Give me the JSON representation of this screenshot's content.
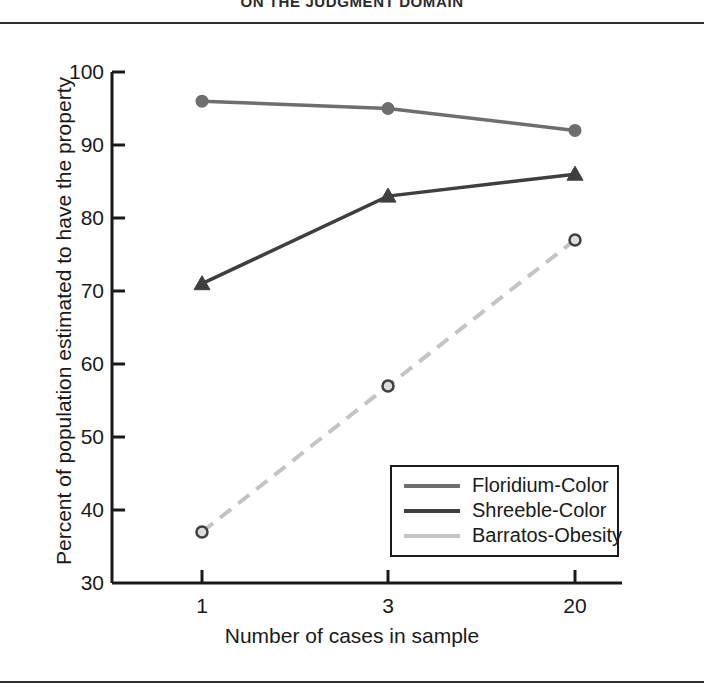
{
  "page": {
    "header_title": "ON THE JUDGMENT DOMAIN"
  },
  "colors": {
    "floridium": "#6e6e6e",
    "shreeble": "#3f3f3f",
    "barratos": "#c4c4c4",
    "axis": "#1a1a1a",
    "background": "#ffffff"
  },
  "chart_data": {
    "type": "line",
    "title": "",
    "xlabel": "Number of cases in sample",
    "ylabel": "Percent of population estimated to have the property",
    "categories": [
      "1",
      "3",
      "20"
    ],
    "xtick_labels": [
      "1",
      "3",
      "20"
    ],
    "ytick_labels": [
      "100",
      "90",
      "80",
      "70",
      "60",
      "50",
      "40",
      "30"
    ],
    "ylim": [
      30,
      100
    ],
    "ytick_step": 10,
    "grid": false,
    "legend_position": "lower right",
    "series": [
      {
        "name": "Floridium-Color",
        "values": [
          96,
          95,
          92
        ],
        "color": "#6e6e6e",
        "marker": "circle",
        "dash": "solid"
      },
      {
        "name": "Shreeble-Color",
        "values": [
          71,
          83,
          86
        ],
        "color": "#3f3f3f",
        "marker": "triangle",
        "dash": "solid"
      },
      {
        "name": "Barratos-Obesity",
        "values": [
          37,
          57,
          77
        ],
        "color": "#c4c4c4",
        "marker": "circle",
        "dash": "dashed"
      }
    ]
  },
  "legend": {
    "items": [
      {
        "label": "Floridium-Color"
      },
      {
        "label": "Shreeble-Color"
      },
      {
        "label": "Barratos-Obesity"
      }
    ]
  }
}
